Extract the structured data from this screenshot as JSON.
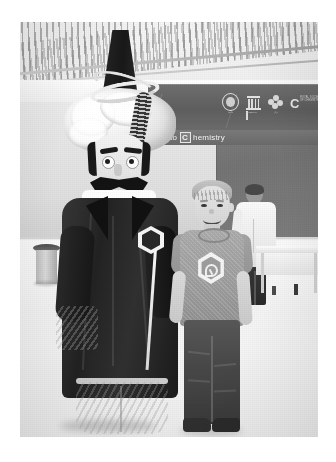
{
  "image": {
    "kind": "photograph",
    "color_mode": "black-and-white",
    "caption": "A costumed mascot in a turban and long dark robe stands beside a smiling boy inside an exhibition hall",
    "frame": {
      "background_color": "#ffffff"
    }
  },
  "scene": {
    "venue_label": "exhibition hall",
    "ceiling": {
      "name": "slatted-ceiling",
      "pattern": "diagonal louvered slats"
    },
    "floor": {
      "name": "polished-floor",
      "color": "#efefef"
    }
  },
  "signage": {
    "banner_text": "to",
    "banner_boxed_letter": "C",
    "banner_word": "hemistry",
    "full_text": "to Chemistry",
    "logos": [
      {
        "name": "emblem-round-logo",
        "caption": "جامعة"
      },
      {
        "name": "institution-pillars-logo",
        "caption": "MUSEUM"
      },
      {
        "name": "cluster-circles-logo",
        "caption": "مركز"
      },
      {
        "name": "royal-society-c-logo",
        "letter": "C",
        "caption": "ROYAL SOCIETY OF CHEMISTRY"
      }
    ],
    "banner_color": "#63656a"
  },
  "subjects": {
    "mascot": {
      "name": "costumed-mascot",
      "description": "Historical Ottoman-style scholar character costume",
      "hat": "tall black conical hat",
      "headwear": "large white turban",
      "facial_hair": "black handlebar mustache",
      "robe": "long dark robe with white cuffs",
      "trousers": "cream patterned pantaloons",
      "prop": "staff topped with a hexagonal molecule ring"
    },
    "boy": {
      "name": "boy",
      "description": "Smiling young boy with short light hair",
      "shirt": "grey t-shirt with hexagonal logo",
      "shirt_logo": "hexagon-badge-logo",
      "trousers": "dark jeans",
      "shoes": "dark sneakers"
    },
    "background_person": {
      "name": "lab-coat-person",
      "description": "Person in a white lab coat standing at a table"
    }
  },
  "objects": [
    {
      "name": "trash-bin",
      "label": "waste bin"
    },
    {
      "name": "bench",
      "label": "low bench"
    },
    {
      "name": "display-table",
      "label": "display table"
    },
    {
      "name": "wall-poster",
      "label": "poster on wall"
    }
  ]
}
